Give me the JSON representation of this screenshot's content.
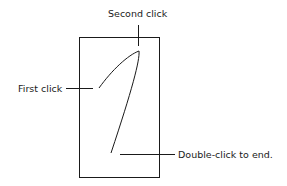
{
  "diagram": {
    "type": "freeform-drawing-instructions",
    "labels": {
      "second_click": "Second click",
      "first_click": "First click",
      "double_click": "Double-click to end."
    },
    "colors": {
      "stroke": "#1a1a1a",
      "background": "#ffffff"
    }
  }
}
